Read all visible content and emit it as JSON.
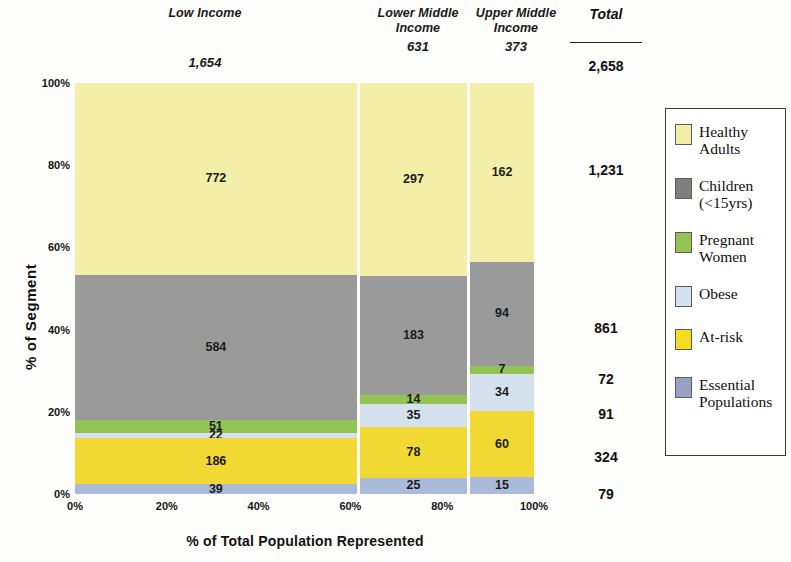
{
  "chart_data": {
    "type": "bar",
    "subtype": "marimekko-mosaic-100pct-stacked",
    "title": "",
    "xlabel": "% of Total Population Represented",
    "ylabel": "% of Segment",
    "xlim": [
      0,
      100
    ],
    "ylim": [
      0,
      100
    ],
    "xtick_labels": [
      "0%",
      "20%",
      "40%",
      "60%",
      "80%",
      "100%"
    ],
    "ytick_labels": [
      "0%",
      "20%",
      "40%",
      "60%",
      "80%",
      "100%"
    ],
    "grid": false,
    "legend_position": "right",
    "categories": [
      "Low Income",
      "Lower Middle Income",
      "Upper Middle Income"
    ],
    "category_totals": [
      "1,654",
      "631",
      "373"
    ],
    "category_widths_pct": [
      62.2,
      23.7,
      14.1
    ],
    "series": [
      {
        "name": "Healthy Adults",
        "color": "#F4EFA8",
        "values": [
          772,
          297,
          162
        ],
        "labels": [
          "772",
          "297",
          "162"
        ],
        "total": "1,231"
      },
      {
        "name": "Children (<15yrs)",
        "color": "#9A9A9A",
        "values": [
          584,
          183,
          94
        ],
        "labels": [
          "584",
          "183",
          "94"
        ],
        "total": "861"
      },
      {
        "name": "Pregnant Women",
        "color": "#93C255",
        "values": [
          51,
          14,
          7
        ],
        "labels": [
          "51",
          "14",
          "7"
        ],
        "total": "72"
      },
      {
        "name": "Obese",
        "color": "#D3E2EE",
        "values": [
          22,
          35,
          34
        ],
        "labels": [
          "22",
          "35",
          "34"
        ],
        "total": "91"
      },
      {
        "name": "At-risk",
        "color": "#F2D832",
        "values": [
          186,
          78,
          60
        ],
        "labels": [
          "186",
          "78",
          "60"
        ],
        "total": "324"
      },
      {
        "name": "Essential Populations",
        "color": "#A9BBD8",
        "values": [
          39,
          25,
          15
        ],
        "labels": [
          "39",
          "25",
          "15"
        ],
        "total": "79"
      }
    ]
  },
  "header": {
    "columns": [
      {
        "name": "Low Income",
        "line1": "Low Income",
        "line2": "",
        "count": "1,654"
      },
      {
        "name": "Lower Middle Income",
        "line1": "Lower Middle",
        "line2": "Income",
        "count": "631"
      },
      {
        "name": "Upper Middle Income",
        "line1": "Upper Middle",
        "line2": "Income",
        "count": "373"
      }
    ],
    "total_label": "Total",
    "grand_total": "2,658"
  },
  "axes": {
    "y_title": "% of Segment",
    "x_title": "% of Total Population Represented",
    "y_ticks": [
      "100%",
      "80%",
      "60%",
      "40%",
      "20%",
      "0%"
    ],
    "x_ticks": [
      "0%",
      "20%",
      "40%",
      "60%",
      "80%",
      "100%"
    ]
  },
  "row_totals": [
    "1,231",
    "861",
    "72",
    "91",
    "324",
    "79"
  ],
  "legend": {
    "items": [
      {
        "label": "Healthy\nAdults",
        "icon": "color-swatch-icon",
        "color": "#F4EFA8"
      },
      {
        "label": "Children\n(<15yrs)",
        "icon": "color-swatch-icon",
        "color": "#7E7E7E"
      },
      {
        "label": "Pregnant\nWomen",
        "icon": "color-swatch-icon",
        "color": "#93C255"
      },
      {
        "label": "Obese",
        "icon": "color-swatch-icon",
        "color": "#D3E2EE"
      },
      {
        "label": "At-risk",
        "icon": "color-swatch-icon",
        "color": "#F5DC1E"
      },
      {
        "label": "Essential\nPopulations",
        "icon": "color-swatch-icon",
        "color": "#9AA0C4"
      }
    ]
  }
}
